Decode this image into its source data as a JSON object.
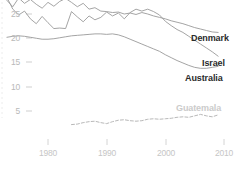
{
  "chart_data": {
    "type": "line",
    "title": "",
    "subtitle": "",
    "xlabel": "",
    "ylabel": "",
    "xlim": [
      1973,
      2011
    ],
    "ylim": [
      0,
      28.5
    ],
    "grid": false,
    "legend_position": "right-inline",
    "x_ticks": [
      "1980",
      "1990",
      "2000",
      "2010"
    ],
    "x_tick_values": [
      1980,
      1990,
      2000,
      2010
    ],
    "y_ticks": [
      "5",
      "10",
      "15",
      "20",
      "25"
    ],
    "y_tick_values": [
      5,
      10,
      15,
      20,
      25
    ],
    "series": [
      {
        "name": "Denmark",
        "style": "solid",
        "color": "#9a9a9a",
        "label_faint": false,
        "x": [
          1973,
          1974,
          1975,
          1976,
          1977,
          1978,
          1979,
          1980,
          1981,
          1982,
          1983,
          1984,
          1985,
          1986,
          1987,
          1988,
          1989,
          1990,
          1991,
          1992,
          1993,
          1994,
          1995,
          1996,
          1997,
          1998,
          1999,
          2000,
          2001,
          2002,
          2003,
          2004,
          2005,
          2006,
          2007,
          2008,
          2009
        ],
        "values": [
          27.8,
          26.5,
          28.3,
          27.2,
          28.0,
          27.0,
          26.2,
          27.4,
          26.6,
          27.6,
          28.2,
          27.4,
          26.5,
          27.2,
          26.0,
          26.3,
          25.6,
          25.5,
          25.3,
          25.4,
          25.0,
          25.2,
          24.9,
          25.3,
          25.0,
          24.6,
          24.3,
          24.0,
          23.6,
          23.3,
          23.0,
          22.6,
          22.2,
          21.9,
          21.6,
          21.3,
          21.2
        ]
      },
      {
        "name": "Israel",
        "style": "solid",
        "color": "#9a9a9a",
        "label_faint": false,
        "x": [
          1973,
          1974,
          1975,
          1976,
          1977,
          1978,
          1979,
          1980,
          1981,
          1982,
          1983,
          1984,
          1985,
          1986,
          1987,
          1988,
          1989,
          1990,
          1991,
          1992,
          1993,
          1994,
          1995,
          1996,
          1997,
          1998,
          1999,
          2000,
          2001,
          2002,
          2003,
          2004,
          2005,
          2006,
          2007,
          2008,
          2009
        ],
        "values": [
          28.4,
          26.0,
          24.8,
          25.6,
          24.0,
          23.0,
          24.5,
          23.2,
          22.0,
          22.1,
          22.0,
          25.5,
          24.4,
          23.4,
          24.6,
          23.8,
          24.3,
          25.4,
          24.6,
          25.2,
          24.0,
          25.3,
          26.0,
          25.6,
          26.0,
          25.5,
          24.8,
          23.5,
          22.6,
          21.8,
          21.2,
          20.4,
          19.6,
          18.8,
          18.0,
          17.2,
          16.3
        ]
      },
      {
        "name": "Australia",
        "style": "solid",
        "color": "#9a9a9a",
        "label_faint": false,
        "x": [
          1973,
          1974,
          1975,
          1976,
          1977,
          1978,
          1979,
          1980,
          1981,
          1982,
          1983,
          1984,
          1985,
          1986,
          1987,
          1988,
          1989,
          1990,
          1991,
          1992,
          1993,
          1994,
          1995,
          1996,
          1997,
          1998,
          1999,
          2000,
          2001,
          2002,
          2003,
          2004,
          2005,
          2006,
          2007,
          2008,
          2009
        ],
        "values": [
          20.2,
          20.4,
          20.5,
          20.4,
          20.2,
          20.0,
          19.8,
          19.8,
          19.9,
          20.1,
          20.3,
          20.5,
          20.6,
          20.7,
          20.8,
          20.9,
          20.9,
          20.8,
          20.9,
          20.7,
          20.3,
          19.8,
          19.3,
          18.8,
          18.3,
          17.8,
          17.3,
          16.6,
          16.0,
          15.4,
          14.9,
          14.4,
          14.0,
          13.8,
          13.8,
          14.0,
          14.2
        ]
      },
      {
        "name": "Guatemala",
        "style": "dashed",
        "color": "#b0b0b0",
        "label_faint": true,
        "x": [
          1984,
          1985,
          1986,
          1987,
          1988,
          1989,
          1990,
          1991,
          1992,
          1993,
          1994,
          1995,
          1996,
          1997,
          1998,
          1999,
          2000,
          2001,
          2002,
          2003,
          2004,
          2005,
          2006,
          2007,
          2008,
          2009
        ],
        "values": [
          2.2,
          2.3,
          2.6,
          2.8,
          2.9,
          2.6,
          2.4,
          2.8,
          3.1,
          3.2,
          3.0,
          2.9,
          3.0,
          3.3,
          3.4,
          3.3,
          3.4,
          3.5,
          3.7,
          3.8,
          3.7,
          4.0,
          4.3,
          4.0,
          3.8,
          4.2
        ]
      }
    ]
  },
  "axis": {
    "y_labels": [
      "25",
      "20",
      "15",
      "10",
      "5"
    ],
    "x_labels": [
      "1980",
      "1990",
      "2000",
      "2010"
    ]
  },
  "series_labels": {
    "denmark": "Denmark",
    "israel": "Israel",
    "australia": "Australia",
    "guatemala": "Guatemala"
  }
}
